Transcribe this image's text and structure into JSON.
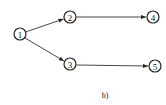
{
  "diagram": {
    "caption": "b)",
    "nodes": [
      {
        "id": "1",
        "label": "1",
        "cx": 20,
        "cy": 34
      },
      {
        "id": "2",
        "label": "2",
        "cx": 70,
        "cy": 17
      },
      {
        "id": "3",
        "label": "3",
        "cx": 70,
        "cy": 64
      },
      {
        "id": "4",
        "label": "4",
        "cx": 153,
        "cy": 17
      },
      {
        "id": "5",
        "label": "5",
        "cx": 155,
        "cy": 66
      }
    ],
    "edges": [
      {
        "from": "1",
        "to": "2"
      },
      {
        "from": "1",
        "to": "3"
      },
      {
        "from": "2",
        "to": "4"
      },
      {
        "from": "3",
        "to": "5"
      }
    ],
    "colors": {
      "stroke": "#222222",
      "background": "#ffffff"
    }
  }
}
